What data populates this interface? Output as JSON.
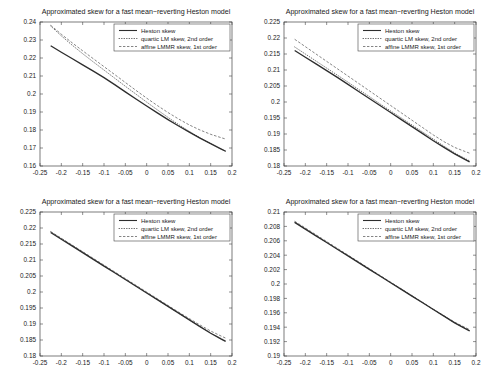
{
  "figure": {
    "layout": "2x2-grid",
    "background_color": "#ffffff",
    "panel_count": 4
  },
  "legend": {
    "position": "top-right-inside",
    "entries": [
      {
        "label": "Heston skew",
        "style": "solid",
        "color": "#2e2e2e"
      },
      {
        "label": "quartic LM skew, 2nd order",
        "style": "dotted",
        "color": "#555555"
      },
      {
        "label": "affine LMMR skew, 1st order",
        "style": "dashed",
        "color": "#666666"
      }
    ]
  },
  "chart_data": [
    {
      "id": "panel-top-left",
      "type": "line",
      "title": "Approximated skew for a fast mean−reverting Heston model",
      "xlabel": "",
      "ylabel": "",
      "xlim": [
        -0.25,
        0.2
      ],
      "ylim": [
        0.16,
        0.24
      ],
      "xticks": [
        -0.25,
        -0.2,
        -0.15,
        -0.1,
        -0.05,
        0,
        0.05,
        0.1,
        0.15,
        0.2
      ],
      "xticklabels": [
        "-0.25",
        "-0.2",
        "-0.15",
        "-0.1",
        "-0.05",
        "0",
        "0.05",
        "0.1",
        "0.15",
        "0.2"
      ],
      "yticks": [
        0.16,
        0.17,
        0.18,
        0.19,
        0.2,
        0.21,
        0.22,
        0.23,
        0.24
      ],
      "yticklabels": [
        "0.16",
        "0.17",
        "0.18",
        "0.19",
        "0.2",
        "0.21",
        "0.22",
        "0.23",
        "0.24"
      ],
      "grid": false,
      "x": [
        -0.225,
        -0.2,
        -0.175,
        -0.15,
        -0.125,
        -0.1,
        -0.075,
        -0.05,
        -0.025,
        0,
        0.025,
        0.05,
        0.075,
        0.1,
        0.125,
        0.15,
        0.175,
        0.185
      ],
      "series": [
        {
          "name": "Heston skew",
          "style": "solid",
          "values": [
            0.2268,
            0.2232,
            0.2197,
            0.2162,
            0.2127,
            0.2091,
            0.2052,
            0.2012,
            0.1972,
            0.1933,
            0.1895,
            0.1858,
            0.1822,
            0.1788,
            0.1755,
            0.1724,
            0.1694,
            0.1682
          ]
        },
        {
          "name": "quartic LM skew, 2nd order",
          "style": "dotted",
          "values": [
            0.2378,
            0.2323,
            0.2272,
            0.2224,
            0.2178,
            0.2133,
            0.2088,
            0.2043,
            0.1999,
            0.1955,
            0.1912,
            0.187,
            0.183,
            0.1792,
            0.1757,
            0.1724,
            0.1694,
            0.1682
          ]
        },
        {
          "name": "affine LMMR skew, 1st order",
          "style": "dashed",
          "values": [
            0.2382,
            0.2332,
            0.2285,
            0.224,
            0.2196,
            0.2152,
            0.2108,
            0.2064,
            0.202,
            0.1977,
            0.1936,
            0.1897,
            0.1861,
            0.1828,
            0.18,
            0.1776,
            0.1757,
            0.175
          ]
        }
      ]
    },
    {
      "id": "panel-top-right",
      "type": "line",
      "title": "Approximated skew for a fast mean−reverting Heston model",
      "xlabel": "",
      "ylabel": "",
      "xlim": [
        -0.25,
        0.2
      ],
      "ylim": [
        0.18,
        0.225
      ],
      "xticks": [
        -0.25,
        -0.2,
        -0.15,
        -0.1,
        -0.05,
        0,
        0.05,
        0.1,
        0.15,
        0.2
      ],
      "xticklabels": [
        "-0.25",
        "-0.2",
        "-0.15",
        "-0.1",
        "-0.05",
        "0",
        "0.05",
        "0.1",
        "0.15",
        "0.2"
      ],
      "yticks": [
        0.18,
        0.185,
        0.19,
        0.195,
        0.2,
        0.205,
        0.21,
        0.215,
        0.22,
        0.225
      ],
      "yticklabels": [
        "0.18",
        "0.185",
        "0.19",
        "0.195",
        "0.2",
        "0.205",
        "0.21",
        "0.215",
        "0.22",
        "0.225"
      ],
      "grid": false,
      "x": [
        -0.225,
        -0.2,
        -0.175,
        -0.15,
        -0.125,
        -0.1,
        -0.075,
        -0.05,
        -0.025,
        0,
        0.025,
        0.05,
        0.075,
        0.1,
        0.125,
        0.15,
        0.175,
        0.185
      ],
      "series": [
        {
          "name": "Heston skew",
          "style": "solid",
          "values": [
            0.2161,
            0.214,
            0.2119,
            0.2098,
            0.2077,
            0.2055,
            0.2033,
            0.2011,
            0.1989,
            0.1967,
            0.1945,
            0.1923,
            0.1901,
            0.1879,
            0.1858,
            0.1838,
            0.182,
            0.1813
          ]
        },
        {
          "name": "quartic LM skew, 2nd order",
          "style": "dotted",
          "values": [
            0.2172,
            0.215,
            0.2128,
            0.2106,
            0.2084,
            0.2062,
            0.2039,
            0.2017,
            0.1994,
            0.1972,
            0.195,
            0.1928,
            0.1906,
            0.1884,
            0.1862,
            0.1841,
            0.1823,
            0.1816
          ]
        },
        {
          "name": "affine LMMR skew, 1st order",
          "style": "dashed",
          "values": [
            0.2196,
            0.2173,
            0.215,
            0.2127,
            0.2104,
            0.2081,
            0.2058,
            0.2035,
            0.2012,
            0.1989,
            0.1966,
            0.1943,
            0.192,
            0.1897,
            0.1876,
            0.1858,
            0.1845,
            0.184
          ]
        }
      ]
    },
    {
      "id": "panel-bottom-left",
      "type": "line",
      "title": "Approximated skew for a fast mean−reverting Heston model",
      "xlabel": "",
      "ylabel": "",
      "xlim": [
        -0.25,
        0.2
      ],
      "ylim": [
        0.18,
        0.225
      ],
      "xticks": [
        -0.25,
        -0.2,
        -0.15,
        -0.1,
        -0.05,
        0,
        0.05,
        0.1,
        0.15,
        0.2
      ],
      "xticklabels": [
        "-0.25",
        "-0.2",
        "-0.15",
        "-0.1",
        "-0.05",
        "0",
        "0.05",
        "0.1",
        "0.15",
        "0.2"
      ],
      "yticks": [
        0.18,
        0.185,
        0.19,
        0.195,
        0.2,
        0.205,
        0.21,
        0.215,
        0.22,
        0.225
      ],
      "yticklabels": [
        "0.18",
        "0.185",
        "0.19",
        "0.195",
        "0.2",
        "0.205",
        "0.21",
        "0.215",
        "0.22",
        "0.225"
      ],
      "grid": false,
      "x": [
        -0.225,
        -0.2,
        -0.175,
        -0.15,
        -0.125,
        -0.1,
        -0.075,
        -0.05,
        -0.025,
        0,
        0.025,
        0.05,
        0.075,
        0.1,
        0.125,
        0.15,
        0.175,
        0.185
      ],
      "series": [
        {
          "name": "Heston skew",
          "style": "solid",
          "values": [
            0.2186,
            0.2165,
            0.2144,
            0.2123,
            0.2102,
            0.2081,
            0.206,
            0.2039,
            0.2018,
            0.1997,
            0.1976,
            0.1955,
            0.1934,
            0.1913,
            0.1892,
            0.1871,
            0.1853,
            0.1846
          ]
        },
        {
          "name": "quartic LM skew, 2nd order",
          "style": "dotted",
          "values": [
            0.2188,
            0.2167,
            0.2146,
            0.2125,
            0.2103,
            0.2082,
            0.2061,
            0.204,
            0.2019,
            0.1998,
            0.1976,
            0.1955,
            0.1934,
            0.1913,
            0.1892,
            0.1872,
            0.1854,
            0.1847
          ]
        },
        {
          "name": "affine LMMR skew, 1st order",
          "style": "dashed",
          "values": [
            0.2189,
            0.2168,
            0.2147,
            0.2126,
            0.2105,
            0.2084,
            0.2063,
            0.2042,
            0.2021,
            0.2,
            0.1979,
            0.1958,
            0.1937,
            0.1917,
            0.1897,
            0.1878,
            0.1862,
            0.1856
          ]
        }
      ]
    },
    {
      "id": "panel-bottom-right",
      "type": "line",
      "title": "Approximated skew for a fast mean−reverting Heston model",
      "xlabel": "",
      "ylabel": "",
      "xlim": [
        -0.25,
        0.2
      ],
      "ylim": [
        0.19,
        0.21
      ],
      "xticks": [
        -0.25,
        -0.2,
        -0.15,
        -0.1,
        -0.05,
        0,
        0.05,
        0.1,
        0.15,
        0.2
      ],
      "xticklabels": [
        "-0.25",
        "-0.2",
        "-0.15",
        "-0.1",
        "-0.05",
        "0",
        "0.05",
        "0.1",
        "0.15",
        "0.2"
      ],
      "yticks": [
        0.19,
        0.192,
        0.194,
        0.196,
        0.198,
        0.2,
        0.202,
        0.204,
        0.206,
        0.208,
        0.21
      ],
      "yticklabels": [
        "0.19",
        "0.192",
        "0.194",
        "0.196",
        "0.198",
        "0.2",
        "0.202",
        "0.204",
        "0.206",
        "0.208",
        "0.21"
      ],
      "grid": false,
      "x": [
        -0.225,
        -0.2,
        -0.175,
        -0.15,
        -0.125,
        -0.1,
        -0.075,
        -0.05,
        -0.025,
        0,
        0.025,
        0.05,
        0.075,
        0.1,
        0.125,
        0.15,
        0.175,
        0.185
      ],
      "series": [
        {
          "name": "Heston skew",
          "style": "solid",
          "values": [
            0.20855,
            0.20762,
            0.20669,
            0.20576,
            0.20483,
            0.2039,
            0.20297,
            0.20204,
            0.20111,
            0.20018,
            0.19925,
            0.19832,
            0.19739,
            0.19646,
            0.19553,
            0.1946,
            0.19381,
            0.1935
          ]
        },
        {
          "name": "quartic LM skew, 2nd order",
          "style": "dotted",
          "values": [
            0.20858,
            0.20765,
            0.20672,
            0.20578,
            0.20485,
            0.20392,
            0.20299,
            0.20206,
            0.20112,
            0.20019,
            0.19926,
            0.19833,
            0.1974,
            0.19646,
            0.19553,
            0.19461,
            0.19382,
            0.19351
          ]
        },
        {
          "name": "affine LMMR skew, 1st order",
          "style": "dashed",
          "values": [
            0.20872,
            0.20778,
            0.20684,
            0.2059,
            0.20496,
            0.20402,
            0.20308,
            0.20214,
            0.2012,
            0.20026,
            0.19932,
            0.19838,
            0.19744,
            0.1965,
            0.19558,
            0.1947,
            0.19396,
            0.19368
          ]
        }
      ]
    }
  ]
}
